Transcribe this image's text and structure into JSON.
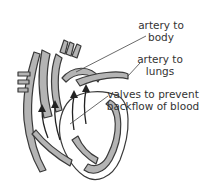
{
  "diagram": {
    "labels": {
      "artery_body": {
        "line1": "artery to",
        "line2": "body"
      },
      "artery_lungs": {
        "line1": "artery to",
        "line2": "lungs"
      },
      "valves": {
        "line1": "valves to prevent",
        "line2": "backflow of blood"
      }
    },
    "colors": {
      "tissue": "#b4b4b4",
      "outline": "#3a3a3a",
      "arrow": "#222222",
      "background": "#ffffff"
    }
  }
}
